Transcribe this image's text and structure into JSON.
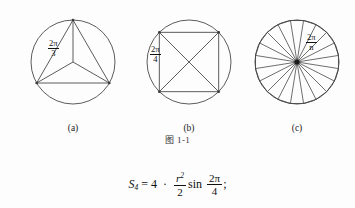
{
  "document": {
    "figure_number": "图 1-1",
    "background_color": "#fdfdfd",
    "line_color": "#4a4a4a",
    "text_color": "#111111"
  },
  "figures": [
    {
      "id": "a",
      "caption": "(a)",
      "description": "circle with inscribed equilateral triangle and central radii",
      "shape": "triangle",
      "sides": 3,
      "angle_label": {
        "numerator": "2π",
        "denominator": "3"
      },
      "circle": {
        "cx": 55,
        "cy": 52,
        "r": 42
      },
      "polygon_rotation_deg": -90
    },
    {
      "id": "b",
      "caption": "(b)",
      "description": "circle with inscribed square and both diagonals",
      "shape": "square",
      "sides": 4,
      "angle_label": {
        "numerator": "2π",
        "denominator": "4"
      },
      "circle": {
        "cx": 55,
        "cy": 52,
        "r": 42
      },
      "polygon_rotation_deg": -135
    },
    {
      "id": "c",
      "caption": "(c)",
      "description": "circle with inscribed regular n-gon divided into n triangles by radii",
      "shape": "n-gon",
      "sides": 20,
      "angle_label": {
        "numerator": "2π",
        "denominator": "n"
      },
      "circle": {
        "cx": 55,
        "cy": 52,
        "r": 42
      },
      "polygon_rotation_deg": -99,
      "center_dot": true
    }
  ],
  "formula": {
    "lhs_symbol": "S",
    "lhs_subscript": "4",
    "equals": "=",
    "coefficient": "4",
    "dot": "·",
    "fraction": {
      "numerator_base": "r",
      "numerator_exponent": "2",
      "denominator": "2"
    },
    "function": "sin",
    "angle": {
      "numerator": "2π",
      "denominator": "4"
    },
    "terminator": ";"
  }
}
